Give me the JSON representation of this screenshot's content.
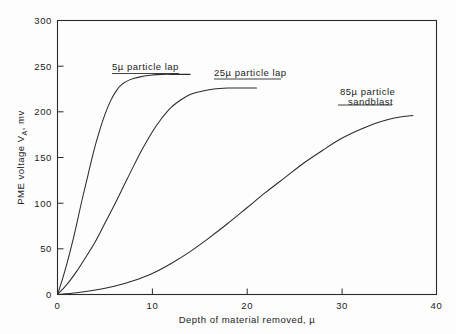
{
  "chart_data": {
    "type": "line",
    "title": "",
    "xlabel": "Depth of material removed, µ",
    "ylabel": "PME voltage  Vₐ , mv",
    "ylabel_parts": {
      "prefix": "PME voltage  V",
      "subscript": "A",
      "suffix": ", mv"
    },
    "xlim": [
      0,
      40
    ],
    "ylim": [
      0,
      300
    ],
    "xticks": [
      0,
      10,
      20,
      30,
      40
    ],
    "xtick_labels": [
      "0",
      "10",
      "20",
      "30",
      "40"
    ],
    "yticks": [
      0,
      50,
      100,
      150,
      200,
      250,
      300
    ],
    "ytick_labels": [
      "0",
      "50",
      "100",
      "150",
      "200",
      "250",
      "300"
    ],
    "grid": false,
    "legend": "inline-annotations",
    "line_color": "#2b2b2b",
    "background_color": "#fdfdfd",
    "series": [
      {
        "name": "5µ particle lap",
        "label_lines": [
          "5µ  particle lap"
        ],
        "x": [
          0,
          0.5,
          1.0,
          1.5,
          2.0,
          2.6,
          3.2,
          3.8,
          4.4,
          5.0,
          5.6,
          6.2,
          6.8,
          7.6,
          8.6,
          9.8,
          11.0,
          12.5,
          14.0
        ],
        "y": [
          0,
          16,
          34,
          54,
          76,
          104,
          130,
          156,
          178,
          197,
          212,
          223,
          230,
          235,
          238,
          240,
          241,
          241,
          241
        ]
      },
      {
        "name": "25µ particle lap",
        "label_lines": [
          "25µ  particle lap"
        ],
        "x": [
          0,
          1.0,
          2.0,
          3.0,
          4.0,
          5.0,
          6.0,
          7.0,
          8.0,
          9.0,
          10.0,
          11.0,
          12.0,
          13.0,
          14.0,
          15.0,
          16.5,
          18.0,
          19.5,
          21.0
        ],
        "y": [
          0,
          11,
          25,
          41,
          58,
          78,
          98,
          119,
          140,
          160,
          178,
          193,
          205,
          213,
          219,
          222,
          225,
          226,
          226,
          226
        ]
      },
      {
        "name": "85µ particle sandblast",
        "label_lines": [
          "85µ  particle",
          "sandblast"
        ],
        "x": [
          0,
          2,
          4,
          6,
          8,
          10,
          12,
          14,
          16,
          18,
          20,
          22,
          24,
          26,
          28,
          30,
          32,
          34,
          36,
          37.5
        ],
        "y": [
          0,
          2,
          5,
          9,
          15,
          23,
          34,
          47,
          62,
          78,
          95,
          112,
          128,
          144,
          158,
          171,
          181,
          189,
          194,
          196
        ]
      }
    ],
    "annotations": [
      {
        "text": "5µ  particle lap",
        "x": 6.0,
        "y": 262
      },
      {
        "text": "25µ  particle lap",
        "x": 17.0,
        "y": 258
      },
      {
        "text": "85µ  particle",
        "x": 30.5,
        "y": 227
      },
      {
        "text": "sandblast",
        "x": 31.5,
        "y": 214
      }
    ]
  }
}
